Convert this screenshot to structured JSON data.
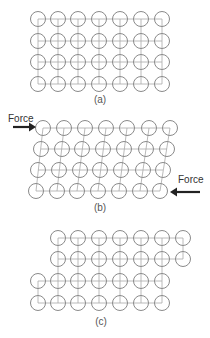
{
  "panels": [
    {
      "label": "(a)",
      "description": "perfect lattice, 4 rows x 7 atoms"
    },
    {
      "label": "(b)",
      "description": "lattice under shear forces"
    },
    {
      "label": "(c)",
      "description": "lattice after slip"
    }
  ],
  "forces": {
    "left": "Force",
    "right": "Force"
  },
  "colors": {
    "atom_stroke": "#8a8a8a",
    "bond": "#a8a8a8",
    "arrow": "#222222"
  }
}
